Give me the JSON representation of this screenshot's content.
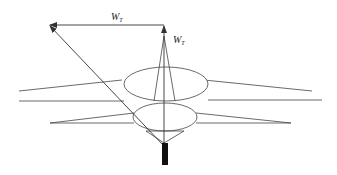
{
  "diagram": {
    "type": "parachute-wind-drift-vector-diagram",
    "labels": {
      "horizontal_vector": {
        "main": "W",
        "sub": "T"
      },
      "vertical_vector": {
        "main": "W",
        "sub": "T"
      }
    },
    "colors": {
      "stroke": "#333333",
      "payload": "#111111",
      "background": "#ffffff"
    }
  }
}
